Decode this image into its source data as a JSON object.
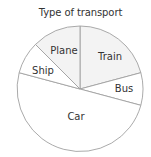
{
  "chart_data": {
    "type": "pie",
    "title": "Type of transport",
    "categories": [
      "Train",
      "Bus",
      "Car",
      "Ship",
      "Plane"
    ],
    "values": [
      75,
      30,
      180,
      30,
      45
    ],
    "units": "degrees",
    "start_angle_deg": 0,
    "direction": "clockwise",
    "colors": [
      "#f3f3f3",
      "#ffffff",
      "#ffffff",
      "#ffffff",
      "#f3f3f3"
    ],
    "stroke_color": "#a0a0a0",
    "legend": "none (labels inside slices)"
  },
  "geometry": {
    "cx": 80,
    "cy": 89,
    "r": 63
  },
  "labels": {
    "Train": {
      "x": 110,
      "y": 60
    },
    "Bus": {
      "x": 124,
      "y": 92
    },
    "Car": {
      "x": 76,
      "y": 120
    },
    "Ship": {
      "x": 43,
      "y": 74
    },
    "Plane": {
      "x": 64,
      "y": 54
    }
  }
}
